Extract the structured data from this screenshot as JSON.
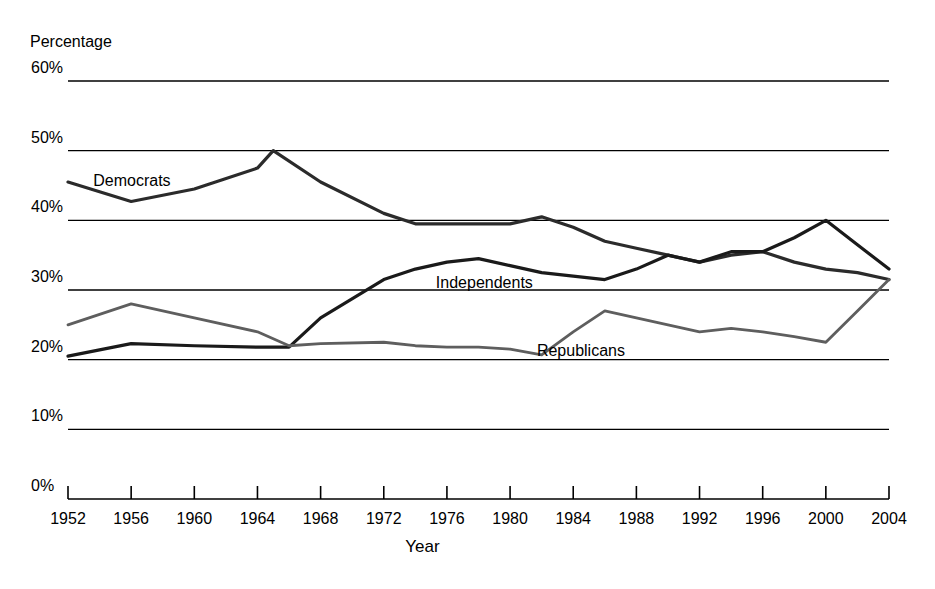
{
  "chart_data": {
    "type": "line",
    "title": "",
    "xlabel": "Year",
    "ylabel": "Percentage",
    "ylim": [
      0,
      60
    ],
    "xlim": [
      1952,
      2004
    ],
    "grid": true,
    "grid_axis": "y",
    "legend": "inline-labels",
    "ytick_labels": [
      "60%",
      "50%",
      "40%",
      "30%",
      "20%",
      "10%",
      "0%"
    ],
    "ytick_values": [
      60,
      50,
      40,
      30,
      20,
      10,
      0
    ],
    "xtick_labels": [
      "1952",
      "1956",
      "1960",
      "1964",
      "1968",
      "1972",
      "1976",
      "1980",
      "1984",
      "1988",
      "1992",
      "1996",
      "2000",
      "2004"
    ],
    "xtick_values": [
      1952,
      1956,
      1960,
      1964,
      1968,
      1972,
      1976,
      1980,
      1984,
      1988,
      1992,
      1996,
      2000,
      2004
    ],
    "series": [
      {
        "name": "Democrats",
        "color": "#2b2b2b",
        "width": 3.2,
        "label_x": 1953.6,
        "label_y": 45.6,
        "x": [
          1952,
          1956,
          1960,
          1964,
          1965,
          1968,
          1972,
          1974,
          1976,
          1978,
          1980,
          1982,
          1984,
          1986,
          1988,
          1990,
          1992,
          1994,
          1996,
          1998,
          2000,
          2002,
          2004
        ],
        "values": [
          45.5,
          42.7,
          44.5,
          47.5,
          50.0,
          45.5,
          41.0,
          39.5,
          39.5,
          39.5,
          39.5,
          40.5,
          39.0,
          37.0,
          36.0,
          35.0,
          34.0,
          35.0,
          35.5,
          34.0,
          33.0,
          32.5,
          31.5
        ]
      },
      {
        "name": "Independents",
        "color": "#1a1a1a",
        "width": 3.2,
        "label_x": 1975.3,
        "label_y": 31.0,
        "x": [
          1952,
          1956,
          1960,
          1964,
          1966,
          1968,
          1972,
          1974,
          1976,
          1978,
          1980,
          1982,
          1984,
          1986,
          1988,
          1990,
          1992,
          1994,
          1996,
          1998,
          2000,
          2002,
          2004
        ],
        "values": [
          20.5,
          22.3,
          22.0,
          21.8,
          21.8,
          26.0,
          31.5,
          33.0,
          34.0,
          34.5,
          33.5,
          32.5,
          32.0,
          31.5,
          33.0,
          35.0,
          34.0,
          35.5,
          35.5,
          37.5,
          40.0,
          36.5,
          33.0
        ]
      },
      {
        "name": "Republicans",
        "color": "#5e5e5e",
        "width": 2.8,
        "label_x": 1981.7,
        "label_y": 21.2,
        "x": [
          1952,
          1956,
          1960,
          1964,
          1966,
          1968,
          1972,
          1974,
          1976,
          1978,
          1980,
          1982,
          1984,
          1986,
          1988,
          1990,
          1992,
          1994,
          1996,
          1998,
          2000,
          2002,
          2004
        ],
        "values": [
          25.0,
          28.0,
          26.0,
          24.0,
          22.0,
          22.3,
          22.5,
          22.0,
          21.8,
          21.8,
          21.5,
          20.7,
          24.0,
          27.0,
          26.0,
          25.0,
          24.0,
          24.5,
          24.0,
          23.3,
          22.5,
          27.0,
          31.5
        ]
      }
    ]
  },
  "axes": {
    "y_title": "Percentage",
    "x_title": "Year"
  }
}
